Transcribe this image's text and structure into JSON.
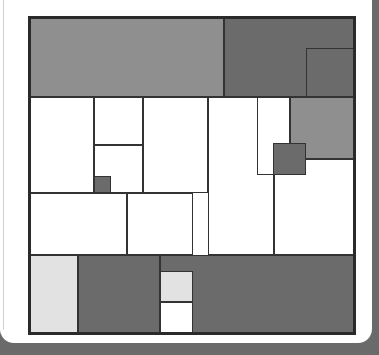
{
  "puzzle": {
    "type": "rectangle-tiling",
    "frame": {
      "x": 28,
      "y": 16,
      "w": 328,
      "h": 319
    },
    "colors": {
      "mid_gray": "#8f8f8f",
      "dark_gray": "#6b6b6b",
      "light_gray": "#e2e2e2",
      "white": "#ffffff",
      "border": "#2a2a2a"
    },
    "rects": [
      {
        "name": "top-left-gray",
        "x": 28,
        "y": 16,
        "w": 196,
        "h": 81,
        "fill": "#8f8f8f"
      },
      {
        "name": "top-right-dark",
        "x": 224,
        "y": 16,
        "w": 132,
        "h": 81,
        "fill": "#6b6b6b"
      },
      {
        "name": "top-right-inner",
        "x": 306,
        "y": 48,
        "w": 50,
        "h": 49,
        "fill": "#6b6b6b"
      },
      {
        "name": "mid-left-white",
        "x": 28,
        "y": 97,
        "w": 66,
        "h": 96,
        "fill": "#ffffff"
      },
      {
        "name": "mid-upper-white",
        "x": 94,
        "y": 97,
        "w": 49,
        "h": 48,
        "fill": "#ffffff"
      },
      {
        "name": "mid-lower-white",
        "x": 94,
        "y": 145,
        "w": 49,
        "h": 48,
        "fill": "#ffffff"
      },
      {
        "name": "small-dark-square",
        "x": 94,
        "y": 176,
        "w": 17,
        "h": 17,
        "fill": "#6b6b6b"
      },
      {
        "name": "tall-white-a",
        "x": 143,
        "y": 97,
        "w": 65,
        "h": 96,
        "fill": "#ffffff"
      },
      {
        "name": "row3-left-white",
        "x": 28,
        "y": 193,
        "w": 99,
        "h": 62,
        "fill": "#ffffff"
      },
      {
        "name": "row3-mid-white",
        "x": 127,
        "y": 193,
        "w": 66,
        "h": 62,
        "fill": "#ffffff"
      },
      {
        "name": "tall-white-b",
        "x": 208,
        "y": 97,
        "w": 66,
        "h": 158,
        "fill": "#ffffff"
      },
      {
        "name": "narrow-white",
        "x": 257,
        "y": 97,
        "w": 33,
        "h": 78,
        "fill": "#ffffff"
      },
      {
        "name": "right-white",
        "x": 274,
        "y": 159,
        "w": 82,
        "h": 96,
        "fill": "#ffffff"
      },
      {
        "name": "right-gray",
        "x": 290,
        "y": 97,
        "w": 66,
        "h": 62,
        "fill": "#8f8f8f"
      },
      {
        "name": "overlap-dark",
        "x": 273,
        "y": 143,
        "w": 33,
        "h": 32,
        "fill": "#6b6b6b"
      },
      {
        "name": "bottom-light",
        "x": 28,
        "y": 255,
        "w": 50,
        "h": 80,
        "fill": "#e2e2e2"
      },
      {
        "name": "bottom-dark-left",
        "x": 78,
        "y": 255,
        "w": 82,
        "h": 80,
        "fill": "#6b6b6b"
      },
      {
        "name": "bottom-dark-right",
        "x": 160,
        "y": 255,
        "w": 196,
        "h": 80,
        "fill": "#6b6b6b"
      },
      {
        "name": "stack-light",
        "x": 160,
        "y": 271,
        "w": 33,
        "h": 31,
        "fill": "#e2e2e2"
      },
      {
        "name": "stack-white",
        "x": 160,
        "y": 302,
        "w": 33,
        "h": 33,
        "fill": "#ffffff"
      }
    ]
  }
}
